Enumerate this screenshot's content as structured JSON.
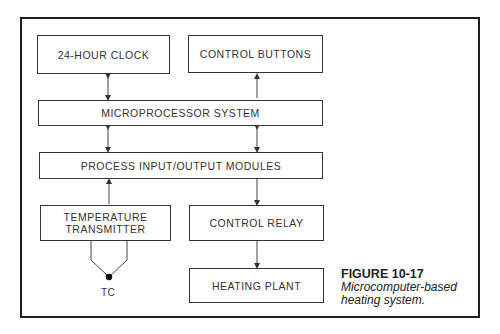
{
  "figure": {
    "number": "FIGURE 10-17",
    "caption_line1": "Microcomputer-based",
    "caption_line2": "heating system."
  },
  "blocks": {
    "clock": "24-HOUR CLOCK",
    "control_buttons": "CONTROL BUTTONS",
    "microprocessor": "MICROPROCESSOR SYSTEM",
    "io_modules": "PROCESS INPUT/OUTPUT MODULES",
    "temp_transmitter_line1": "TEMPERATURE",
    "temp_transmitter_line2": "TRANSMITTER",
    "control_relay": "CONTROL RELAY",
    "heating_plant": "HEATING PLANT"
  },
  "sensor": {
    "label": "TC"
  },
  "connections": [
    {
      "from": "24-HOUR CLOCK",
      "to": "MICROPROCESSOR SYSTEM",
      "type": "bidirectional"
    },
    {
      "from": "CONTROL BUTTONS",
      "to": "MICROPROCESSOR SYSTEM",
      "type": "to_microprocessor"
    },
    {
      "from": "MICROPROCESSOR SYSTEM",
      "to": "PROCESS INPUT/OUTPUT MODULES",
      "type": "bidirectional",
      "side": "left"
    },
    {
      "from": "MICROPROCESSOR SYSTEM",
      "to": "PROCESS INPUT/OUTPUT MODULES",
      "type": "bidirectional",
      "side": "right"
    },
    {
      "from": "TEMPERATURE TRANSMITTER",
      "to": "PROCESS INPUT/OUTPUT MODULES",
      "type": "directed"
    },
    {
      "from": "PROCESS INPUT/OUTPUT MODULES",
      "to": "CONTROL RELAY",
      "type": "directed"
    },
    {
      "from": "CONTROL RELAY",
      "to": "HEATING PLANT",
      "type": "directed"
    },
    {
      "from": "TC",
      "to": "TEMPERATURE TRANSMITTER",
      "type": "thermocouple"
    }
  ]
}
